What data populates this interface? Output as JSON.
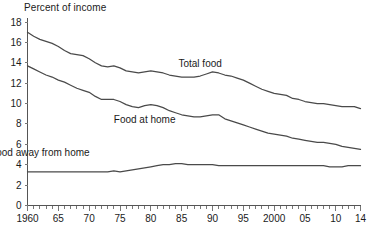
{
  "chart_data": {
    "type": "line",
    "title": "",
    "ylabel": "Percent of income",
    "xlabel": "",
    "ylim": [
      0,
      18
    ],
    "xlim": [
      1960,
      2014
    ],
    "grid": false,
    "legend_position": "inline-annotations",
    "y_ticks": [
      0,
      2,
      4,
      6,
      8,
      10,
      12,
      14,
      16,
      18
    ],
    "y_tick_labels": [
      "0",
      "2",
      "4",
      "6",
      "8",
      "10",
      "12",
      "14",
      "16",
      "18"
    ],
    "x_ticks": [
      1960,
      1965,
      1970,
      1975,
      1980,
      1985,
      1990,
      1995,
      2000,
      2005,
      2010,
      2014
    ],
    "x_tick_labels": [
      "1960",
      "65",
      "70",
      "75",
      "80",
      "85",
      "90",
      "95",
      "2000",
      "05",
      "10",
      "14"
    ],
    "x_minor_tick_step": 1,
    "x": [
      1960,
      1961,
      1962,
      1963,
      1964,
      1965,
      1966,
      1967,
      1968,
      1969,
      1970,
      1971,
      1972,
      1973,
      1974,
      1975,
      1976,
      1977,
      1978,
      1979,
      1980,
      1981,
      1982,
      1983,
      1984,
      1985,
      1986,
      1987,
      1988,
      1989,
      1990,
      1991,
      1992,
      1993,
      1994,
      1995,
      1996,
      1997,
      1998,
      1999,
      2000,
      2001,
      2002,
      2003,
      2004,
      2005,
      2006,
      2007,
      2008,
      2009,
      2010,
      2011,
      2012,
      2013,
      2014
    ],
    "series": [
      {
        "name": "Total food",
        "label": "Total food",
        "label_x": 1988,
        "label_y": 13.6,
        "color": "#4a4a4a",
        "values": [
          17.0,
          16.6,
          16.3,
          16.1,
          15.9,
          15.6,
          15.2,
          14.9,
          14.8,
          14.7,
          14.4,
          14.0,
          13.7,
          13.6,
          13.7,
          13.5,
          13.2,
          13.1,
          13.0,
          13.1,
          13.2,
          13.1,
          13.0,
          12.8,
          12.7,
          12.6,
          12.6,
          12.6,
          12.7,
          12.9,
          13.1,
          13.0,
          12.8,
          12.7,
          12.5,
          12.3,
          12.0,
          11.7,
          11.4,
          11.2,
          11.0,
          10.9,
          10.8,
          10.5,
          10.4,
          10.2,
          10.1,
          10.0,
          10.0,
          9.9,
          9.8,
          9.7,
          9.7,
          9.7,
          9.5
        ],
        "end_value": 9.5
      },
      {
        "name": "Food at home",
        "label": "Food at home",
        "label_x": 1979,
        "label_y": 8.1,
        "color": "#4a4a4a",
        "values": [
          13.7,
          13.4,
          13.1,
          12.8,
          12.6,
          12.3,
          12.1,
          11.8,
          11.5,
          11.3,
          11.1,
          10.7,
          10.4,
          10.4,
          10.4,
          10.2,
          9.9,
          9.7,
          9.6,
          9.8,
          9.9,
          9.8,
          9.6,
          9.3,
          9.1,
          8.9,
          8.8,
          8.7,
          8.7,
          8.8,
          8.9,
          8.9,
          8.5,
          8.3,
          8.1,
          7.9,
          7.7,
          7.5,
          7.3,
          7.1,
          7.0,
          6.9,
          6.8,
          6.6,
          6.5,
          6.4,
          6.3,
          6.2,
          6.2,
          6.1,
          6.0,
          5.8,
          5.7,
          5.6,
          5.5
        ],
        "end_value": 5.5
      },
      {
        "name": "Food away from home",
        "label": "Food away from home",
        "label_x": 1962,
        "label_y": 4.9,
        "color": "#4a4a4a",
        "values": [
          3.3,
          3.3,
          3.3,
          3.3,
          3.3,
          3.3,
          3.3,
          3.3,
          3.3,
          3.3,
          3.3,
          3.3,
          3.3,
          3.3,
          3.4,
          3.3,
          3.4,
          3.5,
          3.6,
          3.7,
          3.8,
          3.9,
          4.0,
          4.0,
          4.1,
          4.1,
          4.0,
          4.0,
          4.0,
          4.0,
          4.0,
          3.9,
          3.9,
          3.9,
          3.9,
          3.9,
          3.9,
          3.9,
          3.9,
          3.9,
          3.9,
          3.9,
          3.9,
          3.9,
          3.9,
          3.9,
          3.9,
          3.9,
          3.9,
          3.8,
          3.8,
          3.8,
          3.9,
          3.9,
          3.9
        ],
        "end_value": 3.9
      }
    ]
  }
}
